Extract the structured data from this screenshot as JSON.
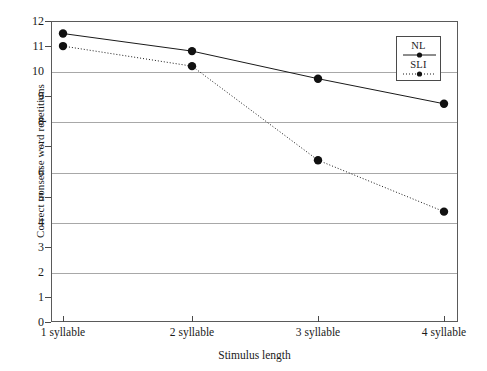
{
  "chart_data": {
    "type": "line",
    "title": "",
    "xlabel": "Stimulus length",
    "ylabel": "Correct nonsense word repetitions",
    "categories": [
      "1 syllable",
      "2 syllable",
      "3 syllable",
      "4 syllable"
    ],
    "series": [
      {
        "name": "NL",
        "values": [
          11.5,
          10.8,
          9.7,
          8.7
        ],
        "style": "solid",
        "marker": "filled-circle",
        "color": "#1a1a1a"
      },
      {
        "name": "SLI",
        "values": [
          11.0,
          10.2,
          6.45,
          4.4
        ],
        "style": "dotted",
        "marker": "filled-circle",
        "color": "#1a1a1a"
      }
    ],
    "ylim": [
      0,
      12
    ],
    "y_ticks": [
      0,
      1,
      2,
      3,
      4,
      5,
      6,
      7,
      8,
      9,
      10,
      11,
      12
    ],
    "y_tick_labels": [
      "0",
      "1",
      "2",
      "3",
      "4",
      "5",
      "6",
      "7",
      "8",
      "9",
      "10",
      "11",
      "12"
    ],
    "gridline_values": [
      2,
      4,
      6,
      8,
      10
    ],
    "grid": true,
    "legend_position": "top-right",
    "colors": {
      "line": "#1a1a1a",
      "grid": "#a8a8a8",
      "frame": "#5a5a5a",
      "text": "#1a1a1a",
      "background": "#ffffff"
    }
  }
}
